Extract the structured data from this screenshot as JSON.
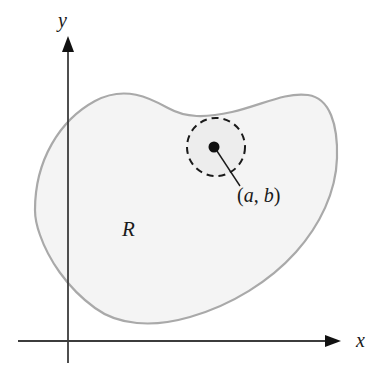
{
  "figure": {
    "background_color": "#ffffff"
  },
  "axes": {
    "x_axis": {
      "label": "x",
      "icon": "arrow-right-icon",
      "color": "#3c3c3c",
      "y_position": 341,
      "x_start": 18,
      "x_end": 340,
      "label_x": 356,
      "label_y": 346
    },
    "y_axis": {
      "label": "y",
      "icon": "arrow-up-icon",
      "color": "#3c3c3c",
      "x_position": 68,
      "y_start": 363,
      "y_end": 38,
      "label_x": 58,
      "label_y": 27
    }
  },
  "region": {
    "label": "R",
    "label_x": 122,
    "label_y": 236,
    "fill_color": "#f4f4f4",
    "stroke_color": "#a9a9a9",
    "stroke_width": 2.2,
    "path": "M 35 210 C 35 160 60 120 95 101 C 125 85 150 98 168 108 C 186 118 205 118 232 112 C 262 105 285 92 308 95 C 330 98 338 125 337 158 C 336 192 320 225 296 252 C 270 281 232 305 190 317 C 152 328 118 325 95 308 C 66 287 48 258 40 235 C 36 224 35 217 35 210 Z"
  },
  "neighborhood": {
    "name": "dashed-disk",
    "center_x": 216,
    "center_y": 147,
    "radius": 29,
    "stroke_color": "#1a1a1a",
    "stroke_width": 2,
    "dash_pattern": "7 5",
    "fill_color": "#ededed"
  },
  "point": {
    "label": "(a, b)",
    "label_prefix": "(",
    "label_var_a": "a",
    "label_separator": ", ",
    "label_var_b": "b",
    "label_suffix": ")",
    "center_x": 214,
    "center_y": 147,
    "dot_radius": 5.5,
    "dot_color": "#111111",
    "label_x": 237,
    "label_y": 202,
    "leader_line": {
      "name": "leader-line",
      "x1": 216,
      "y1": 150,
      "x2": 239,
      "y2": 185,
      "color": "#1a1a1a",
      "width": 1.4
    }
  },
  "colors": {
    "axis": "#3c3c3c",
    "region_fill": "#f4f4f4",
    "region_stroke": "#a9a9a9",
    "accent_dark": "#111111"
  }
}
